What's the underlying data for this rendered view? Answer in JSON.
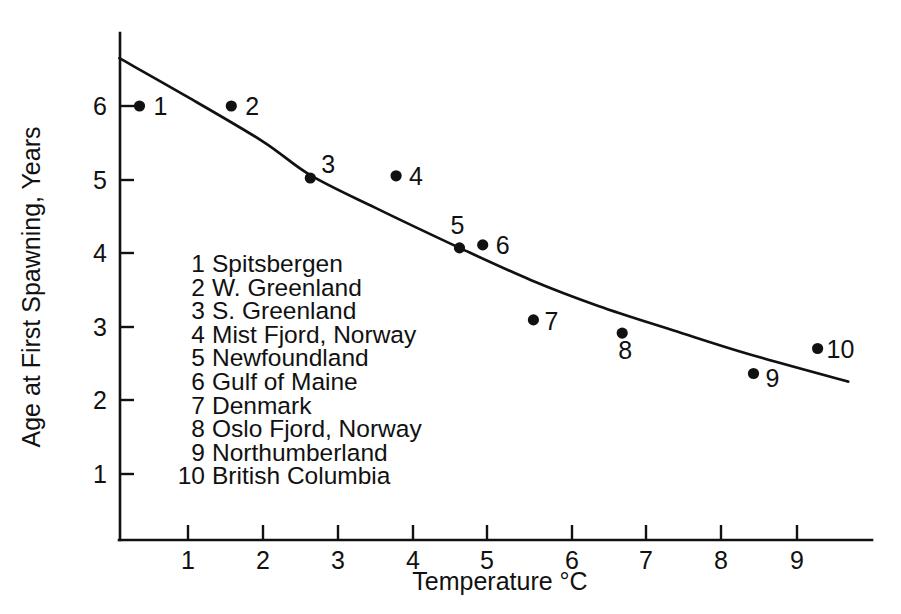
{
  "chart_data": {
    "type": "scatter",
    "title": "",
    "xlabel": "Temperature °C",
    "ylabel": "Age at First Spawning, Years",
    "xlim": [
      0,
      10.1
    ],
    "ylim": [
      0,
      6.9
    ],
    "xticks": [
      1,
      2,
      3,
      4,
      5,
      6,
      7,
      8,
      9
    ],
    "yticks": [
      1,
      2,
      3,
      4,
      5,
      6
    ],
    "grid": false,
    "legend_position": "inside-lower-left",
    "series": [
      {
        "name": "Locations",
        "points": [
          {
            "id": "1",
            "label": "Spitsbergen",
            "x": 0.35,
            "y": 6.0
          },
          {
            "id": "2",
            "label": "W. Greenland",
            "x": 1.58,
            "y": 6.0
          },
          {
            "id": "3",
            "label": "S. Greenland",
            "x": 2.64,
            "y": 5.02
          },
          {
            "id": "4",
            "label": "Mist Fjord, Norway",
            "x": 3.79,
            "y": 5.05
          },
          {
            "id": "5",
            "label": "Newfoundland",
            "x": 4.64,
            "y": 4.07
          },
          {
            "id": "6",
            "label": "Gulf of Maine",
            "x": 4.95,
            "y": 4.11
          },
          {
            "id": "7",
            "label": "Denmark",
            "x": 5.63,
            "y": 3.09
          },
          {
            "id": "8",
            "label": "Oslo Fjord, Norway",
            "x": 6.82,
            "y": 2.91
          },
          {
            "id": "9",
            "label": "Northumberland",
            "x": 8.58,
            "y": 2.36
          },
          {
            "id": "10",
            "label": "British Columbia",
            "x": 9.44,
            "y": 2.7
          }
        ]
      }
    ],
    "fit_curve": {
      "name": "Fitted decline curve",
      "x": [
        0.08,
        1.0,
        2.0,
        2.64,
        3.5,
        4.64,
        5.6,
        6.5,
        7.5,
        8.5,
        9.85
      ],
      "y": [
        6.65,
        6.12,
        5.52,
        5.06,
        4.62,
        4.07,
        3.63,
        3.28,
        2.95,
        2.63,
        2.25
      ]
    },
    "xtick_labels": [
      "1",
      "2",
      "3",
      "4",
      "5",
      "6",
      "7",
      "8",
      "9"
    ],
    "ytick_labels": [
      "1",
      "2",
      "3",
      "4",
      "5",
      "6"
    ],
    "legend_entries": [
      {
        "num": "1",
        "name": "Spitsbergen"
      },
      {
        "num": "2",
        "name": "W. Greenland"
      },
      {
        "num": "3",
        "name": "S. Greenland"
      },
      {
        "num": "4",
        "name": "Mist Fjord, Norway"
      },
      {
        "num": "5",
        "name": "Newfoundland"
      },
      {
        "num": "6",
        "name": "Gulf of Maine"
      },
      {
        "num": "7",
        "name": "Denmark"
      },
      {
        "num": "8",
        "name": "Oslo Fjord, Norway"
      },
      {
        "num": "9",
        "name": "Northumberland"
      },
      {
        "num": "10",
        "name": "British Columbia"
      }
    ],
    "colors": {
      "ink": "#111111",
      "background": "#ffffff"
    }
  }
}
